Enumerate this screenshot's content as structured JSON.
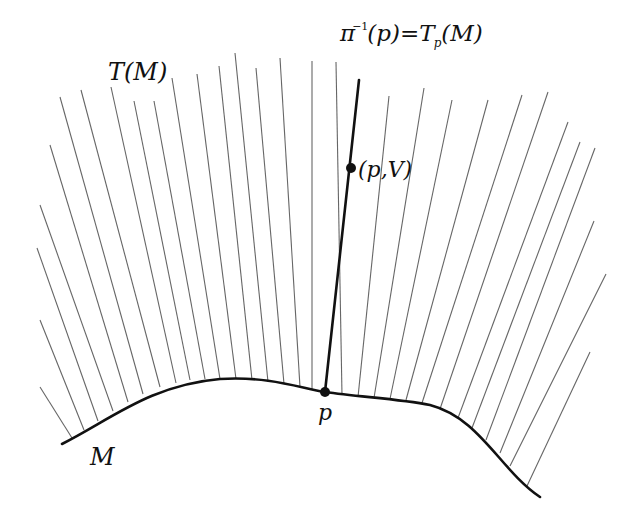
{
  "diagram": {
    "colors": {
      "curve": "#111111",
      "fiber": "#666666",
      "highlight": "#111111",
      "background": "#ffffff"
    },
    "labels": {
      "bundle": "T(M)",
      "base": "M",
      "point": "p",
      "vector_point": "(p,V)",
      "fiber_lhs_pi": "π",
      "fiber_lhs_exp": "−1",
      "fiber_lhs_arg": "(p)=",
      "fiber_rhs_T": "T",
      "fiber_rhs_sub": "p",
      "fiber_rhs_arg": "(M)"
    },
    "curve_path": "M 62 444 C 110 420, 150 385, 220 379 C 270 376, 300 388, 325 392 C 360 397, 400 399, 430 405 C 480 418, 500 470, 540 497",
    "highlight_fiber": {
      "x1": 325,
      "y1": 392,
      "x2": 359,
      "y2": 80
    },
    "highlight_point": {
      "cx": 325,
      "cy": 392,
      "r": 5
    },
    "vector_point": {
      "cx": 351,
      "cy": 168,
      "r": 5
    },
    "fibers": [
      [
        72,
        438,
        40,
        387
      ],
      [
        84,
        430,
        40,
        320
      ],
      [
        98,
        421,
        37,
        248
      ],
      [
        113,
        411,
        40,
        205
      ],
      [
        128,
        402,
        50,
        145
      ],
      [
        143,
        394,
        60,
        97
      ],
      [
        160,
        387,
        81,
        90
      ],
      [
        176,
        383,
        111,
        87
      ],
      [
        190,
        380,
        134,
        101
      ],
      [
        205,
        379,
        154,
        101
      ],
      [
        220,
        379,
        172,
        78
      ],
      [
        236,
        379,
        197,
        74
      ],
      [
        252,
        380,
        219,
        66
      ],
      [
        268,
        382,
        235,
        53
      ],
      [
        284,
        384,
        256,
        68
      ],
      [
        300,
        387,
        280,
        58
      ],
      [
        312,
        390,
        312,
        61
      ],
      [
        342,
        395,
        336,
        62
      ],
      [
        358,
        397,
        389,
        96
      ],
      [
        374,
        398,
        424,
        88
      ],
      [
        390,
        399,
        452,
        100
      ],
      [
        406,
        400,
        488,
        100
      ],
      [
        422,
        403,
        522,
        95
      ],
      [
        440,
        409,
        548,
        92
      ],
      [
        458,
        418,
        568,
        122
      ],
      [
        472,
        428,
        580,
        142
      ],
      [
        486,
        440,
        595,
        148
      ],
      [
        500,
        453,
        594,
        221
      ],
      [
        510,
        466,
        606,
        274
      ],
      [
        527,
        486,
        590,
        352
      ]
    ]
  }
}
